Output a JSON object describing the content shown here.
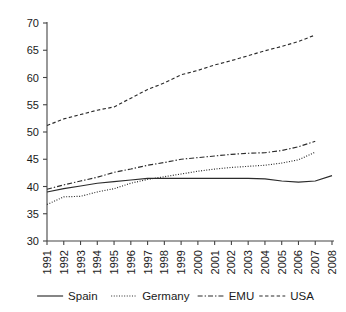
{
  "chart_data": {
    "type": "line",
    "title": "",
    "xlabel": "",
    "ylabel": "",
    "ylim": [
      30,
      70
    ],
    "yticks": [
      30,
      35,
      40,
      45,
      50,
      55,
      60,
      65,
      70
    ],
    "grid": false,
    "legend_position": "bottom",
    "categories": [
      "1991",
      "1992",
      "1993",
      "1994",
      "1995",
      "1996",
      "1997",
      "1998",
      "1999",
      "2000",
      "2001",
      "2002",
      "2003",
      "2004",
      "2005",
      "2006",
      "2007",
      "2008"
    ],
    "x": [
      1991,
      1992,
      1993,
      1994,
      1995,
      1996,
      1997,
      1998,
      1999,
      2000,
      2001,
      2002,
      2003,
      2004,
      2005,
      2006,
      2007,
      2008
    ],
    "series": [
      {
        "name": "Spain",
        "style": "solid",
        "values": [
          39.0,
          39.6,
          40.1,
          40.6,
          40.9,
          41.2,
          41.5,
          41.5,
          41.5,
          41.5,
          41.5,
          41.5,
          41.5,
          41.4,
          41.0,
          40.8,
          41.0,
          42.0
        ]
      },
      {
        "name": "Germany",
        "style": "dotted",
        "values": [
          36.7,
          38.1,
          38.2,
          39.0,
          39.6,
          40.6,
          41.3,
          41.8,
          42.3,
          42.8,
          43.2,
          43.5,
          43.7,
          43.9,
          44.3,
          44.9,
          46.3,
          null
        ]
      },
      {
        "name": "EMU",
        "style": "dashdot",
        "values": [
          39.5,
          40.3,
          41.0,
          41.7,
          42.6,
          43.2,
          43.9,
          44.4,
          45.0,
          45.3,
          45.6,
          45.9,
          46.1,
          46.2,
          46.6,
          47.3,
          48.3,
          null
        ]
      },
      {
        "name": "USA",
        "style": "dashed",
        "values": [
          51.2,
          52.4,
          53.2,
          54.0,
          54.6,
          56.2,
          57.8,
          59.0,
          60.5,
          61.3,
          62.3,
          63.1,
          64.0,
          64.9,
          65.7,
          66.6,
          67.8,
          null
        ]
      }
    ]
  },
  "legend": {
    "items": [
      {
        "label": "Spain",
        "style": "solid"
      },
      {
        "label": "Germany",
        "style": "dotted"
      },
      {
        "label": "EMU",
        "style": "dashdot"
      },
      {
        "label": "USA",
        "style": "dashed"
      }
    ]
  },
  "colors": {
    "line": "#2b2b2b",
    "axis": "#444444",
    "text": "#1a1a1a",
    "background": "#ffffff"
  }
}
